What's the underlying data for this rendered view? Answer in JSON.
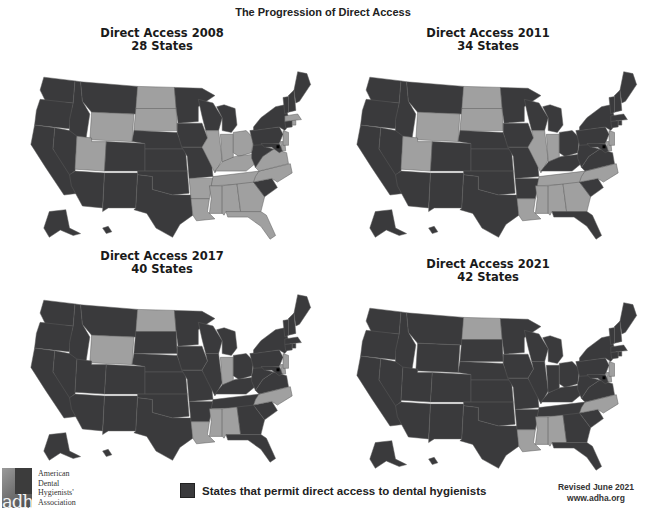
{
  "title": "The Progression of Direct Access",
  "colors": {
    "direct_access": "#3a3a3c",
    "no_direct_access": "#a0a0a0",
    "border": "#5c5c5c",
    "dc": "#000000"
  },
  "panels": [
    {
      "title": "Direct Access 2008",
      "subtitle": "28 States",
      "year": 2008,
      "count": 28,
      "non_direct_access_states": [
        "ND",
        "SD",
        "WY",
        "UT",
        "IL",
        "IN",
        "OH",
        "KY",
        "TN",
        "VA",
        "NC",
        "GA",
        "AL",
        "MS",
        "LA",
        "AR",
        "FL",
        "NJ",
        "DE",
        "MA",
        "RI"
      ]
    },
    {
      "title": "Direct Access 2011",
      "subtitle": "34 States",
      "year": 2011,
      "count": 34,
      "non_direct_access_states": [
        "ND",
        "SD",
        "WY",
        "UT",
        "IL",
        "IN",
        "TN",
        "NC",
        "GA",
        "AL",
        "MS",
        "LA",
        "NJ",
        "DE"
      ]
    },
    {
      "title": "Direct Access 2017",
      "subtitle": "40 States",
      "year": 2017,
      "count": 40,
      "non_direct_access_states": [
        "ND",
        "WY",
        "IN",
        "NC",
        "AL",
        "MS",
        "LA",
        "NJ",
        "DE"
      ]
    },
    {
      "title": "Direct Access 2021",
      "subtitle": "42 States",
      "year": 2021,
      "count": 42,
      "non_direct_access_states": [
        "ND",
        "NC",
        "AL",
        "MS",
        "LA",
        "NJ",
        "DE"
      ]
    }
  ],
  "legend": {
    "label": "States that permit direct access to dental hygienists"
  },
  "footer": {
    "revised": "Revised June 2021",
    "url": "www.adha.org"
  },
  "logo": {
    "letters": "adha",
    "lines": [
      "American",
      "Dental",
      "Hygienists'",
      "Association"
    ]
  }
}
